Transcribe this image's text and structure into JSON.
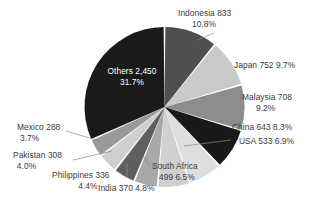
{
  "chart_data": {
    "type": "pie",
    "title": "",
    "subtitle": "",
    "xlabel": "",
    "ylabel": "",
    "grid": false,
    "legend": "none",
    "label_format": "name value percent",
    "start_angle_deg": 0,
    "direction": "clockwise",
    "total": 7720,
    "categories": [
      "Indonesia",
      "Japan",
      "Malaysia",
      "China",
      "USA",
      "South Africa",
      "India",
      "Philippines",
      "Pakistan",
      "Mexico",
      "Others"
    ],
    "values": [
      833,
      752,
      708,
      643,
      533,
      499,
      370,
      336,
      308,
      288,
      2450
    ],
    "percents": [
      10.8,
      9.7,
      9.2,
      8.3,
      6.9,
      6.5,
      4.8,
      4.4,
      4.0,
      3.7,
      31.7
    ],
    "colors": [
      "#4f4f4f",
      "#c9c9c9",
      "#8d8d8d",
      "#191919",
      "#dedede",
      "#d0d0d0",
      "#a8a8a8",
      "#5f5f5f",
      "#cfcfcf",
      "#9a9a9a",
      "#1a1a1a"
    ],
    "slice_label_colors": [
      "#3a3a3a",
      "#3a3a3a",
      "#3a3a3a",
      "#3a3a3a",
      "#3a3a3a",
      "#3a3a3a",
      "#3a3a3a",
      "#3a3a3a",
      "#3a3a3a",
      "#3a3a3a",
      "#ffffff"
    ]
  },
  "labels": {
    "indonesia": {
      "line1": "Indonesia 833",
      "line2": "10.8%"
    },
    "japan": {
      "line1": "Japan 752  9.7%",
      "line2": ""
    },
    "malaysia": {
      "line1": "Malaysia 708",
      "line2": "9.2%"
    },
    "china": {
      "line1": "China 643  8.3%",
      "line2": ""
    },
    "usa": {
      "line1": "USA 533  6.9%",
      "line2": ""
    },
    "south_africa": {
      "line1": "South Africa",
      "line2": "499  6.5%"
    },
    "india": {
      "line1": "India 370  4.8%",
      "line2": ""
    },
    "philippines": {
      "line1": "Philippines 336",
      "line2": "4.4%"
    },
    "pakistan": {
      "line1": "Pakistan 308",
      "line2": "4.0%"
    },
    "mexico": {
      "line1": "Mexico 288",
      "line2": "3.7%"
    },
    "others": {
      "line1": "Others 2,450",
      "line2": "31.7%"
    }
  }
}
